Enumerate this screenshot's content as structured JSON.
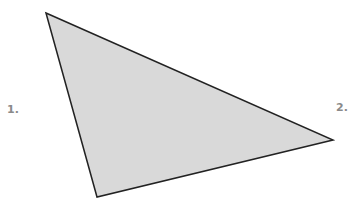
{
  "diagram": {
    "shape": "triangle",
    "fill": "#d9d9d9",
    "stroke": "#222222",
    "vertices": [
      [
        46,
        13
      ],
      [
        333,
        140
      ],
      [
        97,
        197
      ]
    ],
    "labels": [
      {
        "text": "1.",
        "x": 7,
        "y": 103
      },
      {
        "text": "2.",
        "x": 336,
        "y": 101
      }
    ]
  }
}
